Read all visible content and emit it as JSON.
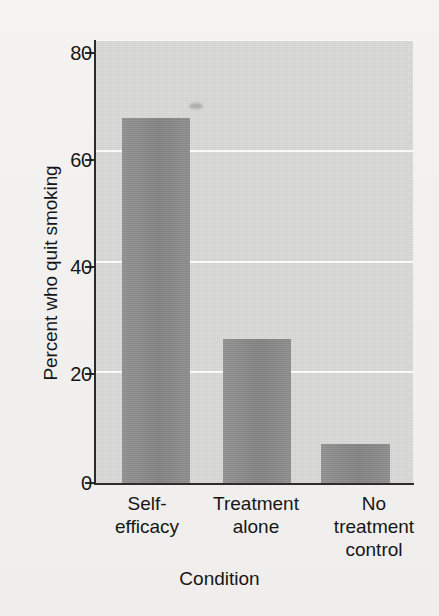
{
  "figure": {
    "background_color": "#f3f2f0",
    "plot_background_color": "#d7d7d5",
    "bar_color": "#8b8b8b",
    "gridline_color": "#fdfdfc",
    "axis_color": "#2b2b2b"
  },
  "chart_data": {
    "type": "bar",
    "title": "",
    "subtitle": "",
    "xlabel": "Condition",
    "ylabel": "Percent who quit smoking",
    "categories": [
      "Self-efficacy",
      "Treatment alone",
      "No treatment control"
    ],
    "category_lines": [
      [
        "Self-",
        "efficacy"
      ],
      [
        "Treatment",
        "alone"
      ],
      [
        "No",
        "treatment",
        "control"
      ]
    ],
    "values": [
      66,
      26,
      7
    ],
    "ylim": [
      0,
      80
    ],
    "yticks": [
      0,
      20,
      40,
      60,
      80
    ],
    "ytick_labels": [
      "0",
      "20",
      "40",
      "60",
      "80"
    ],
    "grid": true,
    "grid_axis": "y",
    "legend": false,
    "legend_position": "none",
    "annotations": []
  }
}
